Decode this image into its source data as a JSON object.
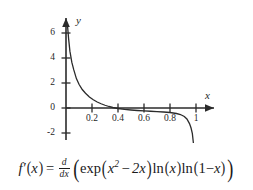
{
  "chart_data": {
    "type": "line",
    "title": "",
    "xlabel": "x",
    "ylabel": "y",
    "xlim": [
      -0.06,
      1.12
    ],
    "ylim": [
      -2.9,
      7.0
    ],
    "grid": false,
    "legend": null,
    "x_ticks": [
      0.2,
      0.4,
      0.6,
      0.8,
      1
    ],
    "x_tick_labels": [
      "0.2",
      "0.4",
      "0.6",
      "0.8",
      "1"
    ],
    "y_ticks": [
      -2,
      0,
      2,
      4,
      6
    ],
    "y_tick_labels": [
      "-2",
      "0",
      "2",
      "4",
      "6"
    ],
    "series": [
      {
        "name": "f'(x)",
        "x": [
          0.012,
          0.02,
          0.03,
          0.045,
          0.06,
          0.08,
          0.1,
          0.125,
          0.15,
          0.18,
          0.21,
          0.24,
          0.27,
          0.3,
          0.33,
          0.36,
          0.4,
          0.45,
          0.5,
          0.55,
          0.6,
          0.65,
          0.7,
          0.75,
          0.8,
          0.85,
          0.88,
          0.91,
          0.93,
          0.95,
          0.962,
          0.972,
          0.98
        ],
        "y": [
          6.55,
          5.55,
          4.55,
          3.65,
          3.05,
          2.35,
          1.9,
          1.48,
          1.18,
          0.88,
          0.66,
          0.48,
          0.34,
          0.22,
          0.12,
          0.04,
          -0.04,
          -0.11,
          -0.16,
          -0.2,
          -0.23,
          -0.26,
          -0.29,
          -0.32,
          -0.36,
          -0.44,
          -0.52,
          -0.68,
          -0.88,
          -1.25,
          -1.6,
          -2.05,
          -2.8
        ]
      }
    ]
  },
  "axes": {
    "y_axis_name": "y",
    "x_axis_name": "x"
  },
  "equation": {
    "lhs_f": "f",
    "lhs_prime": "′",
    "lhs_open": "(",
    "lhs_var": "x",
    "lhs_close": ")",
    "equals": "=",
    "deriv_num": "d",
    "deriv_den": "dx",
    "outer_open": "(",
    "exp_name": "exp",
    "exp_open": "(",
    "exp_base": "x",
    "exp_power": "2",
    "exp_minus": "−",
    "exp_term": "2x",
    "exp_close": ")",
    "ln1_name": "ln",
    "ln1_open": "(",
    "ln1_arg": "x",
    "ln1_close": ")",
    "ln2_name": "ln",
    "ln2_open": "(",
    "ln2_one": "1",
    "ln2_minus": "−",
    "ln2_var": "x",
    "ln2_close": ")",
    "outer_close": ")",
    "plain_text": "f′(x) = d/dx ( exp(x² − 2x) ln(x) ln(1−x) )"
  },
  "colors": {
    "ink": "#2b2b2b",
    "background": "#ffffff",
    "curve": "#2b2b2b"
  }
}
